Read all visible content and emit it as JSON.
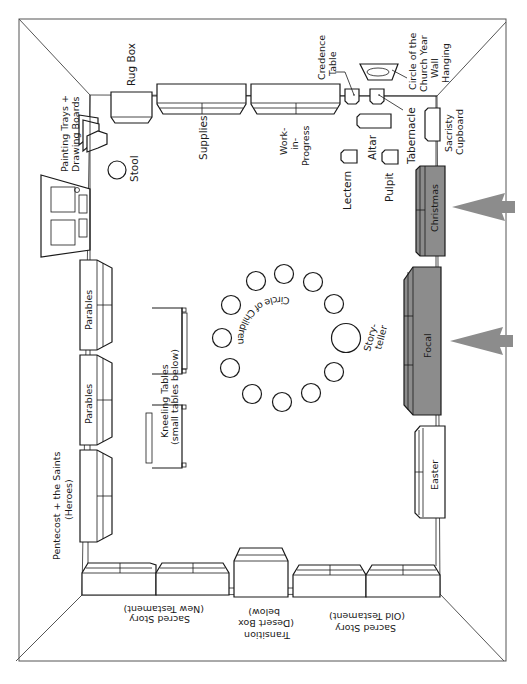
{
  "diagram": {
    "colors": {
      "ink": "#1a1a1a",
      "wall": "#555555",
      "focal_fill": "#8c8c8c",
      "arrow_fill": "#8c8c8c",
      "background": "#ffffff"
    },
    "labels": {
      "rug_box": "Rug Box",
      "supplies": "Supplies",
      "work_in_progress_1": "Work-",
      "work_in_progress_2": "in-",
      "work_in_progress_3": "Progress",
      "credence_table_1": "Credence",
      "credence_table_2": "Table",
      "circle_church_year_1": "Circle of the",
      "circle_church_year_2": "Church Year",
      "circle_church_year_3": "Wall",
      "circle_church_year_4": "Hanging",
      "tabernacle": "Tabernacle",
      "altar": "Altar",
      "lectern": "Lectern",
      "pulpit": "Pulpit",
      "sacristy_cupboard_1": "Sacristy",
      "sacristy_cupboard_2": "Cupboard",
      "christmas": "Christmas",
      "focal": "Focal",
      "easter": "Easter",
      "painting_trays_1": "Painting Trays +",
      "painting_trays_2": "Drawing Boards",
      "stool": "Stool",
      "parables_1": "Parables",
      "parables_2": "Parables",
      "pentecost_1": "Pentecost + the Saints",
      "pentecost_2": "(Heroes)",
      "kneeling_tables_1": "Kneeling Tables",
      "kneeling_tables_2": "(small tables below)",
      "circle_of_children": "Circle of Children",
      "storyteller_1": "Story-",
      "storyteller_2": "teller",
      "sacred_story_nt_1": "Sacred Story",
      "sacred_story_nt_2": "(New Testament)",
      "transition_1": "Transition",
      "transition_2": "(Desert Box",
      "transition_3": "below)",
      "sacred_story_ot_1": "Sacred Story",
      "sacred_story_ot_2": "(Old Testament)"
    },
    "icons": {
      "arrow_christmas": "arrow-pointing-left",
      "arrow_focal": "arrow-pointing-left"
    },
    "children_seats": 11
  }
}
